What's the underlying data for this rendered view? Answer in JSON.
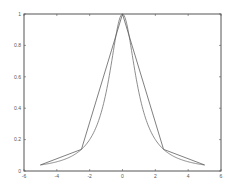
{
  "chart_data": {
    "type": "line",
    "title": "",
    "xlabel": "",
    "ylabel": "",
    "xlim": [
      -6,
      6
    ],
    "ylim": [
      0,
      1
    ],
    "grid": false,
    "legend": null,
    "xticks": [
      -6,
      -4,
      -2,
      0,
      2,
      4,
      6
    ],
    "xtick_labels": [
      "-6",
      "-4",
      "-2",
      "0",
      "2",
      "4",
      "6"
    ],
    "yticks": [
      0,
      0.2,
      0.4,
      0.6,
      0.8,
      1
    ],
    "ytick_labels": [
      "0",
      "0.2",
      "0.4",
      "0.6",
      "0.8",
      "1"
    ],
    "series": [
      {
        "name": "f(x) = 1/(1+x^2)",
        "style": "smooth curve",
        "color": "#707070",
        "x": [
          -5,
          -4.5,
          -4,
          -3.5,
          -3,
          -2.5,
          -2,
          -1.5,
          -1,
          -0.75,
          -0.5,
          -0.25,
          0,
          0.25,
          0.5,
          0.75,
          1,
          1.5,
          2,
          2.5,
          3,
          3.5,
          4,
          4.5,
          5
        ],
        "y": [
          0.0385,
          0.0471,
          0.0588,
          0.0755,
          0.1,
          0.1379,
          0.2,
          0.3077,
          0.5,
          0.64,
          0.8,
          0.9412,
          1,
          0.9412,
          0.8,
          0.64,
          0.5,
          0.3077,
          0.2,
          0.1379,
          0.1,
          0.0755,
          0.0588,
          0.0471,
          0.0385
        ]
      },
      {
        "name": "piecewise linear interpolant",
        "style": "polyline",
        "color": "#606060",
        "x": [
          -5,
          -2.5,
          0,
          2.5,
          5
        ],
        "y": [
          0.0385,
          0.1379,
          1,
          0.1379,
          0.0385
        ]
      }
    ]
  }
}
